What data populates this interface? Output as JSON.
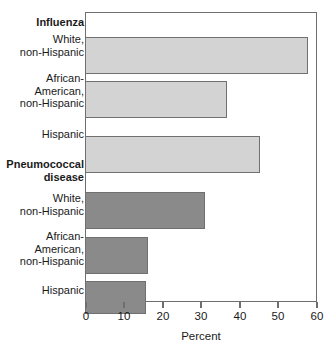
{
  "chart_data": {
    "type": "bar",
    "orientation": "horizontal",
    "title": "",
    "xlabel": "Percent",
    "ylabel": "",
    "xlim": [
      0,
      60
    ],
    "xticks": [
      0,
      10,
      20,
      30,
      40,
      50,
      60
    ],
    "xtick_labels": [
      "0",
      "10",
      "20",
      "30",
      "40",
      "50",
      "60"
    ],
    "grid": false,
    "legend": false,
    "groups": [
      {
        "name": "Influenza",
        "color": "#d3d3d3",
        "categories": [
          "White,\nnon-Hispanic",
          "African-\nAmerican,\nnon-Hispanic",
          "Hispanic"
        ],
        "values": [
          57.6,
          36.7,
          45.2
        ]
      },
      {
        "name": "Pneumococcal\ndisease",
        "color": "#8a8a8a",
        "categories": [
          "White,\nnon-Hispanic",
          "African-\nAmerican,\nnon-Hispanic",
          "Hispanic"
        ],
        "values": [
          31.1,
          16.3,
          15.9
        ]
      }
    ],
    "categories": [
      "Influenza",
      "White, non-Hispanic",
      "African-American, non-Hispanic",
      "Hispanic",
      "Pneumococcal disease",
      "White, non-Hispanic",
      "African-American, non-Hispanic",
      "Hispanic"
    ],
    "values": [
      null,
      57.6,
      36.7,
      45.2,
      null,
      31.1,
      16.3,
      15.9
    ]
  },
  "labels": {
    "group_influenza": "Influenza",
    "influenza_white": "White,\nnon-Hispanic",
    "influenza_black": "African-\nAmerican,\nnon-Hispanic",
    "influenza_hispanic": "Hispanic",
    "group_pneumococcal": "Pneumococcal\ndisease",
    "pneumo_white": "White,\nnon-Hispanic",
    "pneumo_black": "African-\nAmerican,\nnon-Hispanic",
    "pneumo_hispanic": "Hispanic"
  },
  "axis": {
    "title": "Percent",
    "tick_0": "0",
    "tick_10": "10",
    "tick_20": "20",
    "tick_30": "30",
    "tick_40": "40",
    "tick_50": "50",
    "tick_60": "60"
  },
  "colors": {
    "influenza_bar": "#d3d3d3",
    "pneumococcal_bar": "#8a8a8a",
    "bar_border": "#707070",
    "axis": "#6e6e6e",
    "text": "#1a1a1a",
    "background": "#ffffff"
  }
}
